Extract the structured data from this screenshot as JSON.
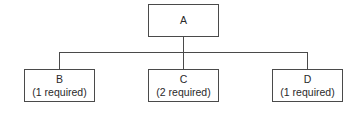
{
  "diagram": {
    "type": "tree",
    "root": {
      "id": "A",
      "label": "A"
    },
    "children": [
      {
        "id": "B",
        "label": "B",
        "note": "(1 required)"
      },
      {
        "id": "C",
        "label": "C",
        "note": "(2 required)"
      },
      {
        "id": "D",
        "label": "D",
        "note": "(1 required)"
      }
    ],
    "edges": [
      {
        "from": "A",
        "to": "B"
      },
      {
        "from": "A",
        "to": "C"
      },
      {
        "from": "A",
        "to": "D"
      }
    ]
  }
}
